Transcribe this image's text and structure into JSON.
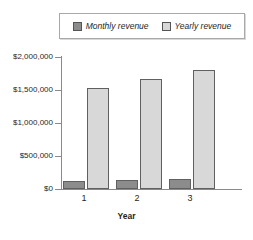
{
  "chart_data": {
    "type": "bar",
    "title": "",
    "subtitle": "",
    "xlabel": "Year",
    "ylabel": "",
    "categories": [
      "1",
      "2",
      "3"
    ],
    "series": [
      {
        "name": "Monthly revenue",
        "values": [
          125000,
          130000,
          145000
        ],
        "color": "#8c8c8c"
      },
      {
        "name": "Yearly revenue",
        "values": [
          1530000,
          1670000,
          1800000
        ],
        "color": "#d8d8d8"
      }
    ],
    "ylim": [
      0,
      2000000
    ],
    "yticks": [
      0,
      500000,
      1000000,
      1500000,
      2000000
    ],
    "ytick_labels": [
      "$0",
      "$500,000",
      "$1,000,000",
      "$1,500,000",
      "$2,000,000"
    ],
    "grid": false,
    "legend_position": "top"
  },
  "legend": {
    "entries": [
      {
        "label": "Monthly revenue",
        "swatch": "dark-grey-swatch"
      },
      {
        "label": "Yearly revenue",
        "swatch": "light-grey-swatch"
      }
    ]
  },
  "axis": {
    "x_title": "Year",
    "x_categories": [
      "1",
      "2",
      "3"
    ],
    "y_labels": [
      "$2,000,000",
      "$1,500,000",
      "$1,000,000",
      "$500,000",
      "$0"
    ]
  },
  "colors": {
    "monthly": "#8c8c8c",
    "yearly": "#d8d8d8",
    "axis": "#8a8a8a",
    "bar_border": "#606060",
    "text": "#1f1f1f",
    "background": "#ffffff"
  }
}
